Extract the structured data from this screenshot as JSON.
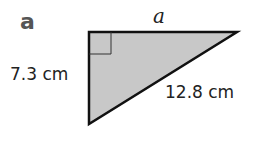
{
  "part_label": "a",
  "labels": {
    "top_side": "a",
    "left_side": "7.3 cm",
    "hypotenuse": "12.8 cm"
  },
  "shape": {
    "type": "right-triangle",
    "fill": "#c8c8c8",
    "stroke": "#111111",
    "vertices": [
      [
        89,
        32
      ],
      [
        237,
        32
      ],
      [
        89,
        124
      ]
    ],
    "right_angle_at": [
      89,
      32
    ]
  }
}
